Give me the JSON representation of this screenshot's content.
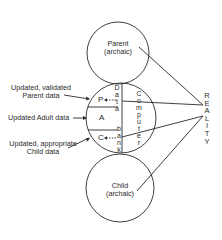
{
  "circles": {
    "parent": {
      "label": "Parent",
      "sub": "(archaic)"
    },
    "adult": {
      "zones": {
        "p": "P",
        "a": "A",
        "c": "C"
      }
    },
    "child": {
      "label": "Child",
      "sub": "(archaic)"
    }
  },
  "left_labels": {
    "parent_data_line1": "Updated, validated",
    "parent_data_line2": "Parent data",
    "adult_data": "Updated Adult data",
    "child_data_line1": "Updated, appropriate",
    "child_data_line2": "Child data"
  },
  "vertical_labels": {
    "data": "D\na\nt\na",
    "bank": "b\na\nn\nk",
    "computer": "C\no\nm\np\nu\nt\ne\nr",
    "reality": "R\nE\nA\nL\nI\nT\nY"
  },
  "colors": {
    "stroke": "#2a2a2a",
    "background": "#ffffff"
  }
}
